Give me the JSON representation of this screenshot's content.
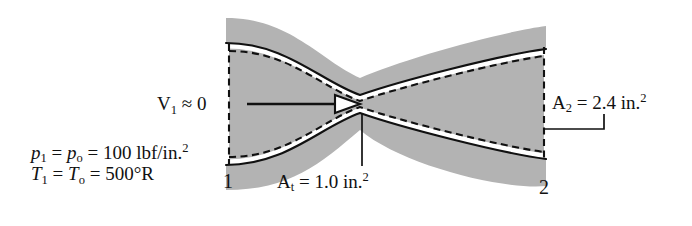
{
  "figure": {
    "type": "converging-diverging-nozzle-diagram",
    "colors": {
      "wall_fill": "#b3b3b3",
      "wall_line": "#111111",
      "flow_line": "#111111",
      "background": "#ffffff",
      "gap": "#ffffff"
    }
  },
  "annotations": {
    "inlet_velocity": {
      "symbol": "V",
      "sub": "1",
      "relation": "≈",
      "value": "0"
    },
    "inlet_pressure": {
      "symbol": "p",
      "sub1": "1",
      "sub2": "o",
      "value": "100",
      "unit": "lbf/in.",
      "exponent": "2"
    },
    "inlet_temperature": {
      "symbol": "T",
      "sub1": "1",
      "sub2": "o",
      "value": "500",
      "unit": "°R"
    },
    "throat_area": {
      "symbol": "A",
      "sub": "t",
      "value": "1.0",
      "unit": "in.",
      "exponent": "2"
    },
    "exit_area": {
      "symbol": "A",
      "sub": "2",
      "value": "2.4",
      "unit": "in.",
      "exponent": "2"
    }
  },
  "stations": [
    {
      "name": "inlet",
      "label": "1"
    },
    {
      "name": "exit",
      "label": "2"
    }
  ],
  "flow_arrow": {
    "name": "flow-direction-arrow",
    "direction": "right"
  },
  "geometry": {
    "inlet_plane_x": 229,
    "throat_x": 360,
    "exit_plane_x": 544,
    "centerline_y": 104
  }
}
